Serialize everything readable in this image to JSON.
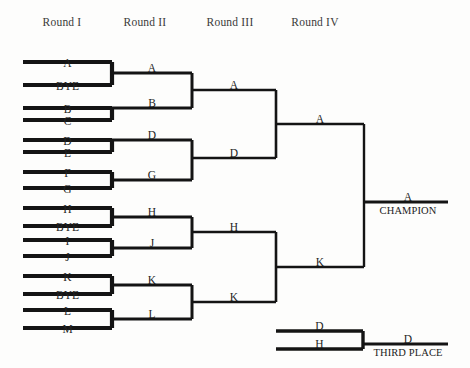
{
  "page": {
    "width": 470,
    "height": 368,
    "background_color": "#fdfdfc",
    "line_color": "#141414",
    "text_color": "#232323",
    "header_color": "#3a3a3a"
  },
  "round_headers": [
    {
      "label": "Round I",
      "x": 62,
      "y": 16
    },
    {
      "label": "Round II",
      "x": 145,
      "y": 16
    },
    {
      "label": "Round III",
      "x": 230,
      "y": 16
    },
    {
      "label": "Round IV",
      "x": 315,
      "y": 16
    }
  ],
  "round1": {
    "header": "Round I",
    "line_x1": 23,
    "line_x2": 112,
    "entries": [
      {
        "label": "A",
        "line_y": 62,
        "label_y": 57
      },
      {
        "label": "BYE",
        "line_y": 85,
        "label_y": 80
      },
      {
        "label": "B",
        "line_y": 108,
        "label_y": 103
      },
      {
        "label": "C",
        "line_y": 120,
        "label_y": 115
      },
      {
        "label": "D",
        "line_y": 140,
        "label_y": 135
      },
      {
        "label": "E",
        "line_y": 152,
        "label_y": 147
      },
      {
        "label": "F",
        "line_y": 172,
        "label_y": 167
      },
      {
        "label": "G",
        "line_y": 188,
        "label_y": 183
      },
      {
        "label": "H",
        "line_y": 208,
        "label_y": 203
      },
      {
        "label": "BYE",
        "line_y": 226,
        "label_y": 221
      },
      {
        "label": "I",
        "line_y": 240,
        "label_y": 235
      },
      {
        "label": "J",
        "line_y": 256,
        "label_y": 251
      },
      {
        "label": "K",
        "line_y": 276,
        "label_y": 271
      },
      {
        "label": "BYE",
        "line_y": 294,
        "label_y": 289
      },
      {
        "label": "L",
        "line_y": 310,
        "label_y": 305
      },
      {
        "label": "M",
        "line_y": 328,
        "label_y": 323
      }
    ],
    "pairs": [
      {
        "top_y": 62,
        "bottom_y": 85,
        "connector_x": 112
      },
      {
        "top_y": 108,
        "bottom_y": 120,
        "connector_x": 112
      },
      {
        "top_y": 140,
        "bottom_y": 152,
        "connector_x": 112
      },
      {
        "top_y": 172,
        "bottom_y": 188,
        "connector_x": 112
      },
      {
        "top_y": 208,
        "bottom_y": 226,
        "connector_x": 112
      },
      {
        "top_y": 240,
        "bottom_y": 256,
        "connector_x": 112
      },
      {
        "top_y": 276,
        "bottom_y": 294,
        "connector_x": 112
      },
      {
        "top_y": 310,
        "bottom_y": 328,
        "connector_x": 112
      }
    ]
  },
  "round2": {
    "header": "Round II",
    "line_x1": 112,
    "line_x2": 192,
    "entries": [
      {
        "label": "A",
        "line_y": 73,
        "label_y": 62
      },
      {
        "label": "B",
        "line_y": 108,
        "label_y": 97
      },
      {
        "label": "D",
        "line_y": 140,
        "label_y": 129
      },
      {
        "label": "G",
        "line_y": 180,
        "label_y": 169
      },
      {
        "label": "H",
        "line_y": 217,
        "label_y": 206
      },
      {
        "label": "J",
        "line_y": 248,
        "label_y": 237
      },
      {
        "label": "K",
        "line_y": 285,
        "label_y": 274
      },
      {
        "label": "L",
        "line_y": 319,
        "label_y": 308
      }
    ],
    "pairs": [
      {
        "top_y": 73,
        "bottom_y": 108,
        "connector_x": 192
      },
      {
        "top_y": 140,
        "bottom_y": 180,
        "connector_x": 192
      },
      {
        "top_y": 217,
        "bottom_y": 248,
        "connector_x": 192
      },
      {
        "top_y": 285,
        "bottom_y": 319,
        "connector_x": 192
      }
    ]
  },
  "round3": {
    "header": "Round III",
    "line_x1": 192,
    "line_x2": 276,
    "entries": [
      {
        "label": "A",
        "line_y": 90,
        "label_y": 79
      },
      {
        "label": "D",
        "line_y": 158,
        "label_y": 147
      },
      {
        "label": "H",
        "line_y": 232,
        "label_y": 221
      },
      {
        "label": "K",
        "line_y": 302,
        "label_y": 291
      }
    ],
    "pairs": [
      {
        "top_y": 90,
        "bottom_y": 158,
        "connector_x": 276
      },
      {
        "top_y": 232,
        "bottom_y": 302,
        "connector_x": 276
      }
    ]
  },
  "round4": {
    "header": "Round IV",
    "line_x1": 276,
    "line_x2": 364,
    "entries": [
      {
        "label": "A",
        "line_y": 124,
        "label_y": 113
      },
      {
        "label": "K",
        "line_y": 267,
        "label_y": 256
      }
    ],
    "pairs": [
      {
        "top_y": 124,
        "bottom_y": 267,
        "connector_x": 364
      }
    ]
  },
  "champion": {
    "winner_label": "A",
    "title_label": "CHAMPION",
    "line_x1": 364,
    "line_x2": 448,
    "line_y": 202,
    "winner_label_x": 408,
    "winner_label_y": 191,
    "title_label_x": 408,
    "title_label_y": 205
  },
  "third_place": {
    "title_label": "THIRD PLACE",
    "winner_label": "D",
    "entries": [
      {
        "label": "D",
        "line_y": 331,
        "label_y": 320
      },
      {
        "label": "H",
        "line_y": 349,
        "label_y": 338
      }
    ],
    "line_x1": 276,
    "line_x2": 363,
    "connector_x": 363,
    "out_line_x1": 363,
    "out_line_x2": 448,
    "out_line_y": 344,
    "winner_label_x": 408,
    "winner_label_y": 333,
    "title_label_x": 408,
    "title_label_y": 347
  }
}
